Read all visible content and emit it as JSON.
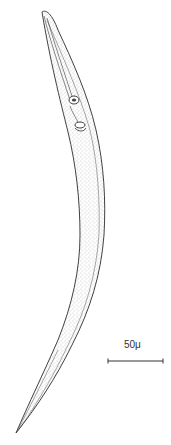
{
  "figure": {
    "scale_bar": {
      "label": "50μ",
      "length_px": 55
    },
    "colors": {
      "background": "#ffffff",
      "ink": "#2b2b2b",
      "stipple": "#7a7a7a"
    }
  }
}
